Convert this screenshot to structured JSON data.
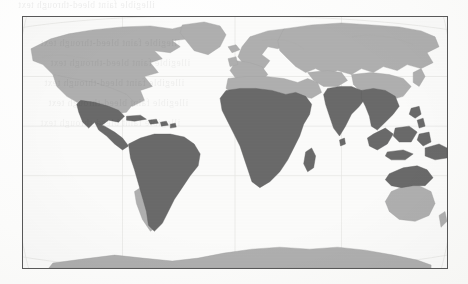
{
  "page": {
    "type": "scanned-book-page",
    "background_color": "#fbfbfa",
    "bleed_through_text": {
      "line_top": "illegible faint bleed-through text",
      "line_2": "illegible faint bleed-through text",
      "line_3": "illegible faint bleed-through text",
      "line_4": "illegible faint bleed-through text",
      "line_5": "illegible faint bleed-through text",
      "line_6": "illegible faint bleed-through text",
      "line_bottom": "illegible faint bleed-through text"
    }
  },
  "figure": {
    "name": "world-map",
    "frame": {
      "border_color": "#585858",
      "border_width_px": 1,
      "x": 22,
      "y": 16,
      "width": 426,
      "height": 253
    },
    "projection": "elliptical / Robinson-style world projection",
    "graticule_visible": true,
    "legend_visible": false,
    "colors": {
      "ocean": "#fcfcfb",
      "land_unhighlighted": "#b0b0b0",
      "land_highlighted": "#6a6a6a",
      "graticule": "#dcdcda",
      "coast_outline": "#9a9a9a"
    },
    "highlighted_regions": [
      "Mexico",
      "Central America",
      "Caribbean",
      "South America",
      "Sub-Saharan Africa",
      "Madagascar",
      "South Asia",
      "Southeast Asia",
      "Indonesia",
      "Philippines",
      "Papua New Guinea",
      "Northern Australia"
    ],
    "unhighlighted_regions": [
      "Canada",
      "United States",
      "Greenland",
      "Europe",
      "North Africa",
      "Russia",
      "Central Asia",
      "China",
      "Japan",
      "Korea",
      "Southern Australia",
      "New Zealand",
      "Antarctica",
      "Southern Chile and Argentina"
    ]
  }
}
